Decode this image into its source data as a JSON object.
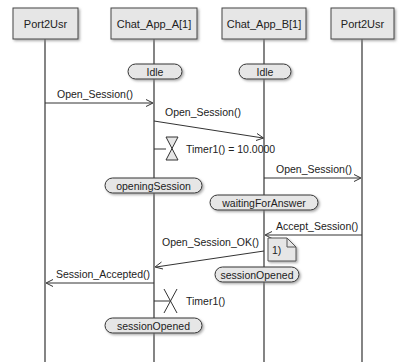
{
  "diagram": {
    "type": "sequence",
    "lifelines": [
      {
        "id": "port_left",
        "label": "Port2Usr"
      },
      {
        "id": "app_a",
        "label": "Chat_App_A[1]"
      },
      {
        "id": "app_b",
        "label": "Chat_App_B[1]"
      },
      {
        "id": "port_right",
        "label": "Port2Usr"
      }
    ],
    "states": {
      "a_idle": "Idle",
      "b_idle": "Idle",
      "a_opening": "openingSession",
      "b_waiting": "waitingForAnswer",
      "b_opened": "sessionOpened",
      "a_opened": "sessionOpened"
    },
    "messages": {
      "m1": "Open_Session()",
      "m2": "Open_Session()",
      "m3": "Open_Session()",
      "m4": "Accept_Session()",
      "m5": "Open_Session_OK()",
      "m6": "Session_Accepted()"
    },
    "timers": {
      "start": "Timer1() = 10.0000",
      "stop": "Timer1()"
    },
    "note": "1)"
  }
}
